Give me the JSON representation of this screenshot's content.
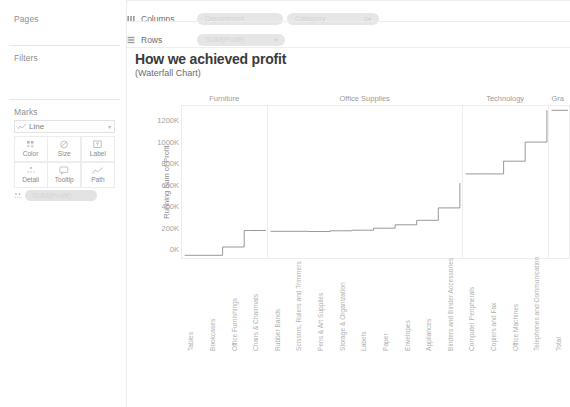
{
  "sidebar": {
    "pages": {
      "title": "Pages"
    },
    "filters": {
      "title": "Filters"
    },
    "marks": {
      "title": "Marks",
      "mark_type": "Line",
      "mark_type_icon": "line-mark-icon",
      "caret": "▾",
      "buttons": [
        {
          "label": "Color",
          "icon": "color-icon"
        },
        {
          "label": "Size",
          "icon": "size-icon"
        },
        {
          "label": "Label",
          "icon": "label-icon"
        },
        {
          "label": "Detail",
          "icon": "detail-icon"
        },
        {
          "label": "Tooltip",
          "icon": "tooltip-icon"
        },
        {
          "label": "Path",
          "icon": "path-icon"
        }
      ],
      "pill": "SUM(Profit)"
    }
  },
  "shelves": {
    "columns": {
      "label": "Columns",
      "icon": "columns-icon",
      "pills": [
        {
          "text": "Department",
          "caret": ""
        },
        {
          "text": "Category",
          "caret": "≡▾"
        }
      ]
    },
    "rows": {
      "label": "Rows",
      "icon": "rows-icon",
      "pills": [
        {
          "text": "SUM(Profit)",
          "caret": "▾"
        }
      ]
    }
  },
  "chart_data": {
    "type": "line",
    "title": "How we achieved profit",
    "subtitle": "(Waterfall Chart)",
    "ylabel": "Running Sum of Profit",
    "xlabel": "",
    "ylim": [
      -80,
      1330
    ],
    "yticks": [
      0,
      200,
      400,
      600,
      800,
      1000,
      1200
    ],
    "ytick_labels": [
      "0K",
      "200K",
      "400K",
      "600K",
      "800K",
      "1000K",
      "1200K"
    ],
    "grid": false,
    "legend": "none",
    "panels": [
      {
        "name": "Furniture",
        "categories": [
          "Tables",
          "Bookcases",
          "Office Furnishings",
          "Chairs & Chairmats"
        ],
        "running_sum": [
          -55,
          -55,
          22,
          175
        ],
        "step_start": -55
      },
      {
        "name": "Office Supplies",
        "categories": [
          "Rubber Bands",
          "Scissors, Rulers and Trimmers",
          "Pens & Art Supplies",
          "Storage & Organization",
          "Labels",
          "Paper",
          "Envelopes",
          "Appliances",
          "Binders and Binder Accessories"
        ],
        "running_sum": [
          168,
          168,
          166,
          172,
          178,
          196,
          228,
          270,
          385
        ],
        "step_start": 168,
        "final": 615
      },
      {
        "name": "Technology",
        "categories": [
          "Computer Peripherals",
          "Copiers and Fax",
          "Office Machines",
          "Telephones and Communication"
        ],
        "running_sum": [
          700,
          700,
          818,
          995
        ],
        "step_start": 700,
        "final": 1290
      },
      {
        "name": "Gra",
        "full_name": "Grand Total",
        "categories": [
          "Total"
        ],
        "running_sum": [
          1290
        ],
        "step_start": 1290
      }
    ]
  }
}
